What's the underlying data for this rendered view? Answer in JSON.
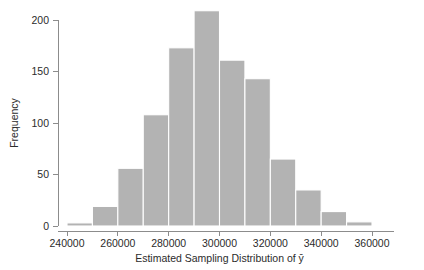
{
  "chart_data": {
    "type": "bar",
    "title": "",
    "subtitle": "",
    "xlabel": "Estimated Sampling Distribution of ȳ",
    "ylabel": "Frequency",
    "grid": false,
    "legend": null,
    "legend_position": "none",
    "xlim": [
      236000,
      364000
    ],
    "ylim": [
      0,
      212
    ],
    "bin_width": 10000,
    "xticks": [
      240000,
      260000,
      280000,
      300000,
      320000,
      340000,
      360000
    ],
    "xtick_labels": [
      "240000",
      "260000",
      "280000",
      "300000",
      "320000",
      "340000",
      "360000"
    ],
    "yticks": [
      0,
      50,
      100,
      150,
      200
    ],
    "ytick_labels": [
      "0",
      "50",
      "100",
      "150",
      "200"
    ],
    "bin_edges": [
      240000,
      250000,
      260000,
      270000,
      280000,
      290000,
      300000,
      310000,
      320000,
      330000,
      340000,
      350000,
      360000
    ],
    "categories": [
      "240000-250000",
      "250000-260000",
      "260000-270000",
      "270000-280000",
      "280000-290000",
      "290000-300000",
      "300000-310000",
      "310000-320000",
      "320000-330000",
      "330000-340000",
      "340000-350000",
      "350000-360000"
    ],
    "values": [
      3,
      19,
      56,
      108,
      173,
      209,
      161,
      143,
      65,
      35,
      14,
      4
    ],
    "bar_color": "#b3b3b3",
    "bar_edge_color": "#ffffff",
    "axis_color": "#8c8c8c",
    "text_color": "#2b2b2b"
  },
  "figure": {
    "background": "#ffffff"
  }
}
